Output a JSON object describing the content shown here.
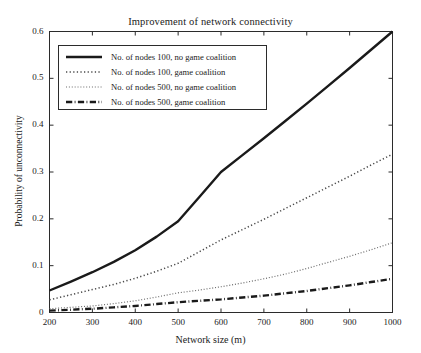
{
  "chart_data": {
    "type": "line",
    "title": "Improvement of network connectivity",
    "xlabel": "Network size (m)",
    "ylabel": "Probability of unconnectivity",
    "xlim": [
      200,
      1000
    ],
    "ylim": [
      0,
      0.6
    ],
    "xticks": [
      200,
      300,
      400,
      500,
      600,
      700,
      800,
      900,
      1000
    ],
    "xticklabels": [
      "200",
      "300",
      "400",
      "500",
      "600",
      "700",
      "800",
      "900",
      "1000"
    ],
    "yticks": [
      0,
      0.1,
      0.2,
      0.3,
      0.4,
      0.5,
      0.6
    ],
    "yticklabels": [
      "0",
      "0.1",
      "0.2",
      "0.3",
      "0.4",
      "0.5",
      "0.6"
    ],
    "grid": false,
    "legend_position": "upper left",
    "x": [
      200,
      250,
      300,
      350,
      400,
      450,
      500,
      550,
      600,
      650,
      700,
      750,
      800,
      850,
      900,
      950,
      1000
    ],
    "series": [
      {
        "name": "No. of nodes 100, no game coalition",
        "style": "solid",
        "color": "#1a1a1a",
        "width": 2.4,
        "values": [
          0.047,
          0.066,
          0.086,
          0.108,
          0.133,
          0.162,
          0.195,
          0.247,
          0.3,
          0.336,
          0.372,
          0.409,
          0.446,
          0.484,
          0.522,
          0.561,
          0.6
        ]
      },
      {
        "name": "No. of nodes 100, game coalition",
        "style": "dotted",
        "color": "#4a4a4a",
        "width": 1.5,
        "values": [
          0.027,
          0.038,
          0.049,
          0.06,
          0.073,
          0.088,
          0.105,
          0.13,
          0.155,
          0.177,
          0.199,
          0.222,
          0.245,
          0.268,
          0.291,
          0.315,
          0.338
        ]
      },
      {
        "name": "No. of nodes 500, no game coalition",
        "style": "dotted",
        "color": "#6e6e6e",
        "width": 1.2,
        "values": [
          0.008,
          0.011,
          0.014,
          0.019,
          0.025,
          0.033,
          0.042,
          0.048,
          0.055,
          0.063,
          0.072,
          0.082,
          0.094,
          0.107,
          0.12,
          0.134,
          0.149
        ]
      },
      {
        "name": "No. of nodes 500, game coalition",
        "style": "dashdot",
        "color": "#1a1a1a",
        "width": 2.4,
        "values": [
          0.004,
          0.006,
          0.008,
          0.011,
          0.014,
          0.018,
          0.022,
          0.025,
          0.028,
          0.032,
          0.036,
          0.041,
          0.046,
          0.052,
          0.058,
          0.065,
          0.072
        ]
      }
    ]
  },
  "legend": {
    "items": [
      {
        "label": "No. of nodes 100, no game coalition"
      },
      {
        "label": "No. of nodes 100, game coalition"
      },
      {
        "label": "No. of nodes 500, no game coalition"
      },
      {
        "label": "No. of nodes 500, game coalition"
      }
    ]
  }
}
